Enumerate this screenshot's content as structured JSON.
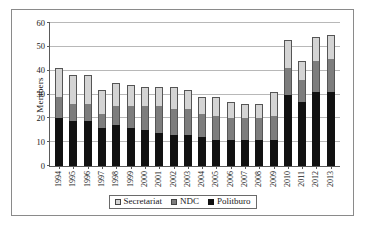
{
  "chart_data": {
    "type": "bar",
    "subtype": "stacked-vertical",
    "title": "",
    "xlabel": "",
    "ylabel": "Members",
    "ylim": [
      0,
      60
    ],
    "ytick_step": 10,
    "yticks": [
      0,
      10,
      20,
      30,
      40,
      50,
      60
    ],
    "grid": true,
    "legend_position": "bottom-center",
    "categories": [
      "1994",
      "1995",
      "1996",
      "1997",
      "1998",
      "1999",
      "2000",
      "2001",
      "2002",
      "2003",
      "2004",
      "2005",
      "2006",
      "2007",
      "2008",
      "2009",
      "2010",
      "2011",
      "2012",
      "2013"
    ],
    "series": [
      {
        "name": "Politburo",
        "color": "#111111",
        "values": [
          20,
          19,
          19,
          16,
          17,
          16,
          15,
          14,
          13,
          13,
          12,
          11,
          11,
          11,
          11,
          11,
          30,
          27,
          31,
          31
        ]
      },
      {
        "name": "NDC",
        "color": "#7d7d7d",
        "values": [
          9,
          7,
          7,
          6,
          8,
          9,
          10,
          11,
          11,
          11,
          10,
          10,
          9,
          9,
          9,
          10,
          11,
          9,
          13,
          14
        ]
      },
      {
        "name": "Secretariat",
        "color": "#d4d4d4",
        "values": [
          12,
          12,
          12,
          10,
          10,
          9,
          8,
          8,
          9,
          8,
          7,
          8,
          7,
          6,
          6,
          10,
          12,
          8,
          10,
          10
        ]
      }
    ],
    "totals": [
      41,
      38,
      38,
      32,
      35,
      34,
      33,
      33,
      33,
      32,
      29,
      29,
      27,
      26,
      26,
      31,
      53,
      44,
      54,
      55
    ],
    "legend": [
      {
        "label": "Secretariat",
        "swatch": "#d4d4d4"
      },
      {
        "label": "NDC",
        "swatch": "#7d7d7d"
      },
      {
        "label": "Politburo",
        "swatch": "#111111"
      }
    ]
  }
}
